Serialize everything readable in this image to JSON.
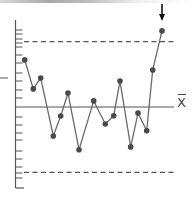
{
  "chart_data": {
    "type": "line",
    "title": "",
    "subtitle": "",
    "xlabel": "",
    "ylabel": "",
    "grid": false,
    "legend": null,
    "chart_kind": "control chart",
    "center_line_label": "X̄",
    "units": "sigma from center line (estimated)",
    "ylim": [
      -3.7,
      4.0
    ],
    "x": [
      1,
      2,
      3,
      4,
      5,
      6,
      7,
      8,
      9,
      10,
      11,
      12,
      13,
      14,
      15,
      16
    ],
    "series": [
      {
        "name": "samples",
        "values": [
          2.16,
          0.83,
          1.33,
          -1.33,
          -0.41,
          0.64,
          -1.96,
          0.28,
          -0.78,
          -0.4,
          1.19,
          -1.83,
          -0.28,
          -1.09,
          1.7,
          3.49
        ]
      }
    ],
    "reference_lines": [
      {
        "name": "UCL",
        "value": 3.0,
        "style": "dashed"
      },
      {
        "name": "center",
        "value": 0.0,
        "style": "solid",
        "label": "X̄"
      },
      {
        "name": "LCL",
        "value": -3.0,
        "style": "dashed"
      }
    ],
    "annotations": [
      {
        "type": "arrow",
        "target_point_index": 15,
        "direction": "down",
        "meaning": "out-of-control point above UCL"
      }
    ]
  },
  "layout": {
    "axis_x": 15.5,
    "axis_top": 20,
    "axis_bottom": 188,
    "axis_foot_end": 24,
    "line_start_dashed": 24,
    "line_end": 174,
    "center_y": 107,
    "px_per_unit": 21.8,
    "point_x": [
      24.7,
      33.3,
      40.7,
      53.3,
      60.7,
      68,
      79,
      93.7,
      105.3,
      113.7,
      120,
      130.7,
      138,
      146.7,
      152.7,
      162
    ],
    "tick_y": [
      30,
      34,
      39,
      43,
      47,
      55,
      63,
      73,
      81,
      90,
      98,
      117,
      125,
      133,
      140,
      151,
      159,
      167,
      173,
      178
    ],
    "side_dash_y": 78
  },
  "labels": {
    "center_line": "X"
  },
  "colors": {
    "axis": "#555555",
    "line": "#6a6a6a",
    "point": "#4a4a4a",
    "dashed": "#555555",
    "arrow": "#111111"
  }
}
